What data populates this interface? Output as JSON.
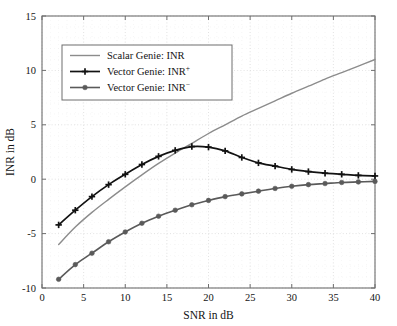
{
  "chart_data": {
    "type": "line",
    "title": "",
    "xlabel": "SNR in dB",
    "ylabel": "INR in dB",
    "xlim": [
      0,
      40
    ],
    "ylim": [
      -10,
      15
    ],
    "xticks": [
      0,
      5,
      10,
      15,
      20,
      25,
      30,
      35,
      40
    ],
    "yticks": [
      -10,
      -5,
      0,
      5,
      10,
      15
    ],
    "xtick_labels": [
      "0",
      "5",
      "10",
      "15",
      "20",
      "25",
      "30",
      "35",
      "40"
    ],
    "ytick_labels": [
      "-10",
      "-5",
      "0",
      "5",
      "10",
      "15"
    ],
    "grid": true,
    "legend_position": "upper left",
    "series": [
      {
        "name": "Scalar Genie: INR",
        "label_base": "Scalar Genie:  INR",
        "label_sup": "",
        "color": "#8c8c8c",
        "marker": "none",
        "linewidth": 1.4,
        "x": [
          2,
          4,
          6,
          8,
          10,
          12,
          14,
          16,
          18,
          20,
          22,
          24,
          26,
          28,
          30,
          32,
          34,
          36,
          38,
          40
        ],
        "y": [
          -6.0,
          -4.4,
          -3.05,
          -1.85,
          -0.7,
          0.4,
          1.45,
          2.4,
          3.3,
          4.2,
          5.0,
          5.8,
          6.5,
          7.2,
          7.9,
          8.55,
          9.2,
          9.8,
          10.4,
          11.0
        ]
      },
      {
        "name": "Vector Genie: INR+",
        "label_base": "Vector Genie:  INR",
        "label_sup": "+",
        "color": "#121212",
        "marker": "plus",
        "linewidth": 1.7,
        "x": [
          2,
          4,
          6,
          8,
          10,
          12,
          14,
          16,
          18,
          20,
          22,
          24,
          26,
          28,
          30,
          32,
          34,
          36,
          38,
          40
        ],
        "y": [
          -4.2,
          -2.85,
          -1.6,
          -0.5,
          0.45,
          1.35,
          2.1,
          2.65,
          3.0,
          2.95,
          2.6,
          2.0,
          1.5,
          1.2,
          0.9,
          0.7,
          0.55,
          0.45,
          0.35,
          0.3
        ]
      },
      {
        "name": "Vector Genie: INR-",
        "label_base": "Vector Genie:  INR",
        "label_sup": "−",
        "color": "#5a5a5a",
        "marker": "circle",
        "linewidth": 1.6,
        "x": [
          2,
          4,
          6,
          8,
          10,
          12,
          14,
          16,
          18,
          20,
          22,
          24,
          26,
          28,
          30,
          32,
          34,
          36,
          38,
          40
        ],
        "y": [
          -9.2,
          -7.85,
          -6.8,
          -5.75,
          -4.85,
          -4.05,
          -3.4,
          -2.85,
          -2.35,
          -1.95,
          -1.6,
          -1.35,
          -1.1,
          -0.85,
          -0.65,
          -0.5,
          -0.4,
          -0.3,
          -0.25,
          -0.2
        ]
      }
    ]
  },
  "axes": {
    "frame_color": "#6e6e6e",
    "grid_color": "#d9d9d9"
  }
}
